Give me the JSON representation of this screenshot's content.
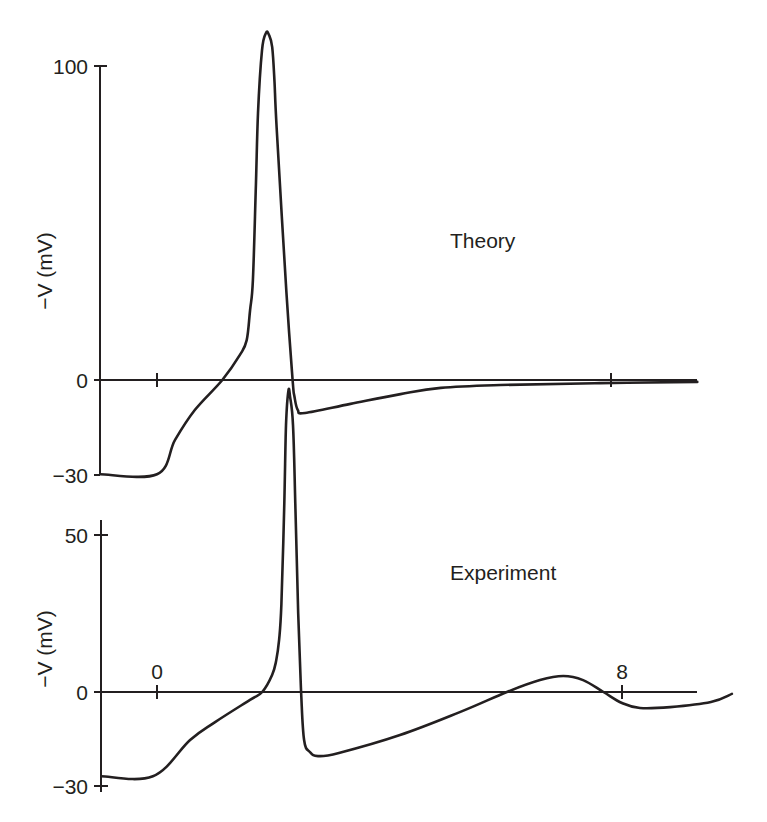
{
  "chart_data": [
    {
      "type": "line",
      "title": "Theory",
      "xlabel": "",
      "ylabel": "−V (mV)",
      "ylim": [
        -30,
        110
      ],
      "xlim": [
        -1,
        9.5
      ],
      "y_ticks": [
        {
          "value": 100,
          "label": "100"
        },
        {
          "value": 0,
          "label": "0"
        },
        {
          "value": -30,
          "label": "−30"
        }
      ],
      "x_ticks": [
        {
          "value": 0,
          "label": ""
        },
        {
          "value": 8,
          "label": ""
        }
      ],
      "grid": false,
      "legend": null,
      "series": [
        {
          "name": "Theory",
          "x": [
            -1.0,
            0.0,
            0.32,
            0.67,
            1.15,
            1.46,
            1.58,
            1.64,
            1.69,
            1.74,
            1.78,
            1.85,
            1.92,
            1.97,
            2.03,
            2.07,
            2.11,
            2.28,
            2.39,
            2.42,
            2.48,
            2.61,
            3.41,
            4.29,
            5.0,
            6.05,
            7.81,
            9.52
          ],
          "y": [
            -30.0,
            -30.0,
            -19.0,
            -9.5,
            0.0,
            8.0,
            12.7,
            22.3,
            31.8,
            60.0,
            85.0,
            105.0,
            110.5,
            110.0,
            106.0,
            95.0,
            80.0,
            28.0,
            0.0,
            -5.0,
            -9.5,
            -10.5,
            -7.6,
            -4.5,
            -2.5,
            -1.6,
            -1.0,
            -0.6
          ]
        }
      ]
    },
    {
      "type": "line",
      "title": "Experiment",
      "xlabel": "",
      "ylabel": "−V (mV)",
      "ylim": [
        -30,
        60
      ],
      "xlim": [
        -1,
        9.9
      ],
      "y_ticks": [
        {
          "value": 50,
          "label": "50"
        },
        {
          "value": 0,
          "label": "0"
        },
        {
          "value": -30,
          "label": "−30"
        }
      ],
      "x_ticks": [
        {
          "value": 0,
          "label": "0"
        },
        {
          "value": 8,
          "label": "8"
        }
      ],
      "grid": false,
      "legend": null,
      "series": [
        {
          "name": "Experiment",
          "x": [
            -0.96,
            -0.07,
            0.57,
            1.0,
            1.6,
            1.81,
            1.98,
            2.05,
            2.1,
            2.14,
            2.19,
            2.22,
            2.26,
            2.29,
            2.34,
            2.38,
            2.43,
            2.48,
            2.53,
            2.63,
            2.77,
            3.13,
            4.18,
            5.21,
            6.02,
            6.59,
            6.99,
            7.33,
            7.68,
            8.0,
            8.31,
            8.83,
            9.53,
            9.89
          ],
          "y": [
            -26.8,
            -26.8,
            -15.3,
            -9.6,
            -2.5,
            0.0,
            5.4,
            10.0,
            16.6,
            28.0,
            60.0,
            85.0,
            95.9,
            94.0,
            85.0,
            60.0,
            25.0,
            0.0,
            -15.3,
            -19.1,
            -20.4,
            -19.4,
            -13.7,
            -6.4,
            0.0,
            3.8,
            5.1,
            3.8,
            0.0,
            -3.5,
            -5.1,
            -4.8,
            -3.2,
            -0.6
          ]
        }
      ]
    }
  ],
  "panels": {
    "top": {
      "label": "Theory",
      "y_axis_title": "−V (mV)",
      "y_tick_labels": [
        "100",
        "0",
        "−30"
      ]
    },
    "bottom": {
      "label": "Experiment",
      "y_axis_title": "−V (mV)",
      "y_tick_labels": [
        "50",
        "0",
        "−30"
      ],
      "x_tick_labels": [
        "0",
        "8"
      ]
    }
  },
  "colors": {
    "ink": "#231f20",
    "background": "#ffffff"
  }
}
